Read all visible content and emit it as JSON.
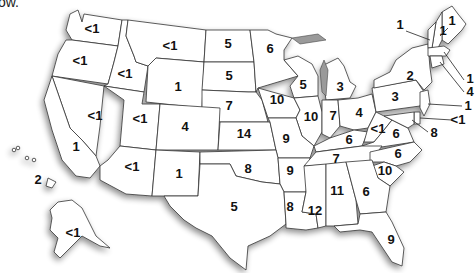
{
  "intro_text": "ow.",
  "map": {
    "type": "US state choropleth-style value map",
    "states": [
      {
        "id": "WA",
        "value": "<1"
      },
      {
        "id": "OR",
        "value": "<1"
      },
      {
        "id": "ID",
        "value": "<1"
      },
      {
        "id": "MT",
        "value": "<1"
      },
      {
        "id": "WY",
        "value": "1"
      },
      {
        "id": "ND",
        "value": "5"
      },
      {
        "id": "SD",
        "value": "5"
      },
      {
        "id": "MN",
        "value": "6"
      },
      {
        "id": "WI",
        "value": "5"
      },
      {
        "id": "MI",
        "value": "3"
      },
      {
        "id": "NE",
        "value": "7"
      },
      {
        "id": "IA",
        "value": "10"
      },
      {
        "id": "IL",
        "value": "10"
      },
      {
        "id": "IN",
        "value": "7"
      },
      {
        "id": "OH",
        "value": "4"
      },
      {
        "id": "PA",
        "value": "3"
      },
      {
        "id": "NY",
        "value": "2"
      },
      {
        "id": "NV",
        "value": "<1"
      },
      {
        "id": "UT",
        "value": "<1"
      },
      {
        "id": "CO",
        "value": "4"
      },
      {
        "id": "KS",
        "value": "14"
      },
      {
        "id": "MO",
        "value": "9"
      },
      {
        "id": "KY",
        "value": "6"
      },
      {
        "id": "WV",
        "value": "<1"
      },
      {
        "id": "VA",
        "value": "6"
      },
      {
        "id": "CA",
        "value": "1"
      },
      {
        "id": "AZ",
        "value": "<1"
      },
      {
        "id": "NM",
        "value": "1"
      },
      {
        "id": "OK",
        "value": "8"
      },
      {
        "id": "AR",
        "value": "9"
      },
      {
        "id": "TN",
        "value": "7"
      },
      {
        "id": "NC",
        "value": "6"
      },
      {
        "id": "SC",
        "value": "10"
      },
      {
        "id": "TX",
        "value": "5"
      },
      {
        "id": "LA",
        "value": "8"
      },
      {
        "id": "MS",
        "value": "12"
      },
      {
        "id": "AL",
        "value": "11"
      },
      {
        "id": "GA",
        "value": "6"
      },
      {
        "id": "FL",
        "value": "9"
      },
      {
        "id": "HI",
        "value": "2"
      },
      {
        "id": "AK",
        "value": "<1"
      },
      {
        "id": "ME",
        "value": "1"
      },
      {
        "id": "NH",
        "value": "1"
      },
      {
        "id": "VT",
        "value": "1"
      },
      {
        "id": "MA",
        "value": "1"
      },
      {
        "id": "CT",
        "value": "4"
      },
      {
        "id": "NJ",
        "value": "1"
      },
      {
        "id": "DE",
        "value": "<1"
      },
      {
        "id": "MD",
        "value": "8"
      }
    ]
  }
}
